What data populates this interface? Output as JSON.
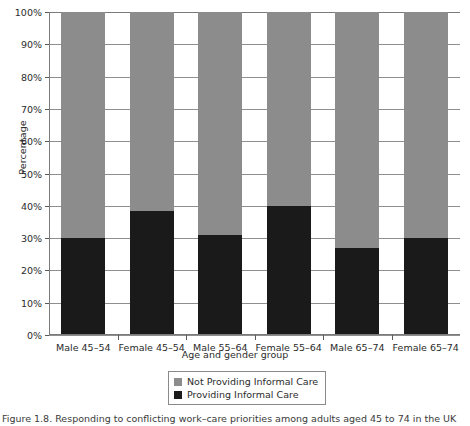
{
  "chart_data": {
    "type": "bar",
    "subtype": "stacked-100-percent",
    "title": "",
    "xlabel": "Age and gender group",
    "ylabel": "Percentage",
    "categories": [
      "Male 45–54",
      "Female 45–54",
      "Male 55–64",
      "Female 55–64",
      "Male 65–74",
      "Female 65–74"
    ],
    "series": [
      {
        "name": "Not Providing Informal Care",
        "color": "#8c8c8c",
        "values": [
          70,
          61.5,
          69,
          60,
          73,
          70
        ]
      },
      {
        "name": "Providing Informal Care",
        "color": "#1a1a1a",
        "values": [
          30,
          38.5,
          31,
          40,
          27,
          30
        ]
      }
    ],
    "ylim": [
      0,
      100
    ],
    "ytick_labels": [
      "0%",
      "10%",
      "20%",
      "30%",
      "40%",
      "50%",
      "60%",
      "70%",
      "80%",
      "90%",
      "100%"
    ],
    "ytick_values": [
      0,
      10,
      20,
      30,
      40,
      50,
      60,
      70,
      80,
      90,
      100
    ],
    "grid": true,
    "grid_axis": "y",
    "legend_position": "below-center",
    "legend_entries": [
      {
        "label": "Not Providing Informal Care",
        "color": "#8c8c8c"
      },
      {
        "label": "Providing Informal Care",
        "color": "#1a1a1a"
      }
    ]
  },
  "caption": {
    "text": "Figure 1.8. Responding to conflicting work–care priorities among adults aged 45 to 74 in the UK"
  },
  "colors": {
    "not_providing": "#8c8c8c",
    "providing": "#1a1a1a",
    "grid": "#8e8e8e",
    "axis": "#7a7a7a",
    "text": "#2b2b2b",
    "background": "#ffffff"
  }
}
